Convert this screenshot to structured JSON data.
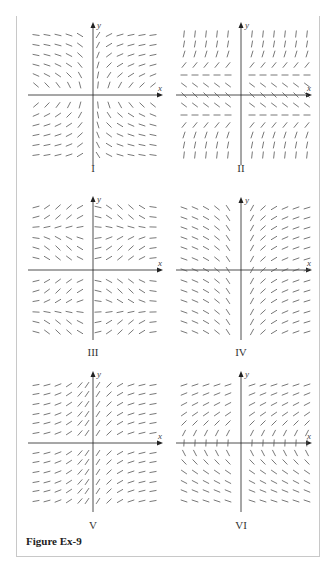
{
  "figure": {
    "caption": "Figure Ex-9",
    "axis_labels": {
      "x": "x",
      "y": "y"
    },
    "colors": {
      "axis": "#222222",
      "segment": "#555555",
      "frame": "#c8c8c8"
    },
    "panels": [
      {
        "id": "I",
        "label": "I",
        "field": "1/(x*y)",
        "description": "Slope field: negative in quadrants II and IV, positive in I and III, steep near axes"
      },
      {
        "id": "II",
        "label": "II",
        "field": "y^2-1",
        "description": "Horizontal slopes along y=1 and y=-1, negative between, positive outside"
      },
      {
        "id": "III",
        "label": "III",
        "field": "sin(x)*sin(y)",
        "description": "Periodic pattern in both x and y"
      },
      {
        "id": "IV",
        "label": "IV",
        "field": "1/x",
        "description": "Negative for x<0, positive for x>0, steep near y-axis"
      },
      {
        "id": "V",
        "label": "V",
        "field": "1/(1+x^2)",
        "description": "Positive slopes, steepest near y-axis, flattening outward"
      },
      {
        "id": "VI",
        "label": "VI",
        "field": "1/y",
        "description": "Positive above x-axis, negative below, steep near x-axis"
      }
    ]
  }
}
